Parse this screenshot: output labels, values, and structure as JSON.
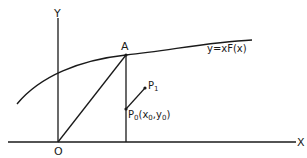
{
  "diagram": {
    "axes": {
      "x_label": "X",
      "y_label": "Y",
      "origin_label": "O"
    },
    "curve": {
      "label": "y=xF(x)"
    },
    "points": {
      "A": {
        "label": "A"
      },
      "P1": {
        "label": "P",
        "sub": "1"
      },
      "P0": {
        "label": "P",
        "sub": "0",
        "coords_prefix": "(x",
        "coords_sub_x": "0",
        "coords_mid": ",y",
        "coords_sub_y": "0",
        "coords_suffix": ")"
      }
    },
    "colors": {
      "stroke": "#1a1a1a",
      "background": "#ffffff"
    }
  }
}
